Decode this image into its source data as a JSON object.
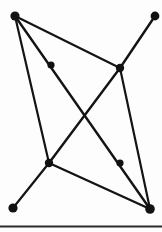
{
  "figure": {
    "width": 162,
    "height": 232,
    "background_color": "#fdfdfd",
    "ink_color": "#141414",
    "vertex_color": "#111111"
  },
  "graph": {
    "vertex_count": 8,
    "edge_count": 10,
    "vertices": [
      {
        "id": "v1",
        "name": "top-left-terminal",
        "x": 15,
        "y": 16,
        "r": 4.6,
        "kind": "terminal"
      },
      {
        "id": "v2",
        "name": "top-right-terminal",
        "x": 155,
        "y": 16,
        "r": 4.4,
        "kind": "terminal"
      },
      {
        "id": "v3",
        "name": "upper-left-midpoint",
        "x": 51,
        "y": 65,
        "r": 3.6,
        "kind": "midpoint"
      },
      {
        "id": "v4",
        "name": "right-hub",
        "x": 120,
        "y": 68,
        "r": 4.2,
        "kind": "junction"
      },
      {
        "id": "v5",
        "name": "center-crossing",
        "x": 85,
        "y": 115,
        "r": 0,
        "kind": "crossing"
      },
      {
        "id": "v6",
        "name": "lower-left-hub",
        "x": 49,
        "y": 163,
        "r": 4.2,
        "kind": "junction"
      },
      {
        "id": "v7",
        "name": "lower-right-midpoint",
        "x": 120,
        "y": 163,
        "r": 3.6,
        "kind": "midpoint"
      },
      {
        "id": "v8",
        "name": "bottom-left-terminal",
        "x": 13,
        "y": 208,
        "r": 4.6,
        "kind": "terminal"
      },
      {
        "id": "v9",
        "name": "bottom-right-terminal",
        "x": 150,
        "y": 209,
        "r": 4.8,
        "kind": "terminal"
      }
    ],
    "edges": [
      {
        "id": "e1",
        "name": "top-left-to-right-hub",
        "from": "v1",
        "to": "v4",
        "x1": 15,
        "y1": 16,
        "x2": 120,
        "y2": 68,
        "width": 2.2
      },
      {
        "id": "e2",
        "name": "top-left-to-bottom-right",
        "from": "v1",
        "to": "v9",
        "x1": 15,
        "y1": 16,
        "x2": 150,
        "y2": 209,
        "width": 2.4
      },
      {
        "id": "e3",
        "name": "top-left-to-lower-left-hub",
        "from": "v1",
        "to": "v6",
        "x1": 15,
        "y1": 16,
        "x2": 49,
        "y2": 163,
        "width": 2.2
      },
      {
        "id": "e4",
        "name": "top-right-to-right-hub",
        "from": "v2",
        "to": "v4",
        "x1": 155,
        "y1": 16,
        "x2": 120,
        "y2": 68,
        "width": 2.4
      },
      {
        "id": "e5",
        "name": "right-hub-to-lower-left-hub",
        "from": "v4",
        "to": "v6",
        "x1": 120,
        "y1": 68,
        "x2": 49,
        "y2": 163,
        "width": 2.4
      },
      {
        "id": "e6",
        "name": "right-hub-to-bottom-right",
        "from": "v4",
        "to": "v9",
        "x1": 120,
        "y1": 68,
        "x2": 150,
        "y2": 209,
        "width": 2.2
      },
      {
        "id": "e7",
        "name": "lower-left-hub-to-bottom-right",
        "from": "v6",
        "to": "v9",
        "x1": 49,
        "y1": 163,
        "x2": 150,
        "y2": 209,
        "width": 2.4
      },
      {
        "id": "e8",
        "name": "lower-left-hub-to-bottom-left",
        "from": "v6",
        "to": "v8",
        "x1": 49,
        "y1": 163,
        "x2": 13,
        "y2": 208,
        "width": 2.2
      }
    ],
    "baseline_rule": {
      "name": "bottom-border-rule",
      "x1": 0,
      "y1": 226.5,
      "x2": 162,
      "y2": 226.5,
      "width": 2.2
    }
  }
}
